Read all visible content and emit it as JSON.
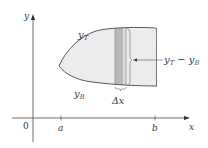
{
  "figure": {
    "type": "area-between-curves",
    "axes": {
      "x_label": "x",
      "y_label": "y",
      "origin_label": "0"
    },
    "ticks": {
      "a": "a",
      "b": "b"
    },
    "curves": {
      "top_label": "y",
      "top_sub": "T",
      "bottom_label": "y",
      "bottom_sub": "B"
    },
    "strip": {
      "width_label": "Δx",
      "height_label_top": "y",
      "height_label_top_sub": "T",
      "height_label_minus": " − ",
      "height_label_bottom": "y",
      "height_label_bottom_sub": "B"
    },
    "colors": {
      "region_fill": "#ececec",
      "strip_fill": "#b9b9b9",
      "strip_border_fill": "#dcdcdc",
      "outline": "#5a5a5a",
      "axis": "#4a4a4a",
      "text": "#3a3a3a"
    }
  }
}
